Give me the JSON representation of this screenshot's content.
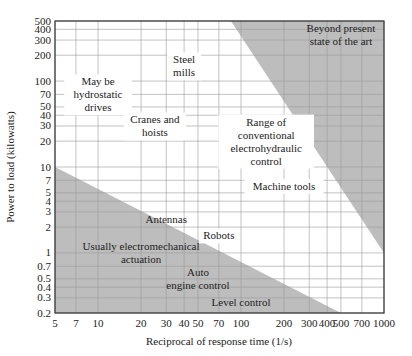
{
  "chart_data": {
    "type": "area",
    "title": "",
    "xlabel": "Reciprocal of response time (1/s)",
    "ylabel": "Power to load (kilowatts)",
    "xscale": "log",
    "yscale": "log",
    "xlim": [
      5,
      1000
    ],
    "ylim": [
      0.2,
      500
    ],
    "grid": true,
    "x_ticks": [
      5,
      7,
      10,
      20,
      30,
      40,
      50,
      70,
      100,
      200,
      300,
      400,
      500,
      700,
      1000
    ],
    "x_tick_labels": [
      "5",
      "7",
      "10",
      "20",
      "30",
      "40",
      "50",
      "70",
      "100",
      "200",
      "300",
      "400",
      "500",
      "700",
      "1000"
    ],
    "y_ticks": [
      0.2,
      0.3,
      0.4,
      0.5,
      0.7,
      1,
      2,
      3,
      4,
      5,
      7,
      10,
      20,
      30,
      40,
      50,
      70,
      100,
      200,
      300,
      400,
      500
    ],
    "y_tick_labels": [
      "0.2",
      "0.3",
      "0.4",
      "0.5",
      "0.7",
      "1",
      "2",
      "3",
      "4",
      "5",
      "7",
      "10",
      "20",
      "30",
      "40",
      "50",
      "70",
      "100",
      "200",
      "300",
      "400",
      "500"
    ],
    "series": [
      {
        "name": "Usually electromechanical actuation (lower boundary)",
        "x": [
          5,
          500
        ],
        "y": [
          10,
          0.2
        ]
      },
      {
        "name": "Beyond present state of the art (upper boundary)",
        "x": [
          85,
          1000
        ],
        "y": [
          500,
          1
        ]
      }
    ],
    "regions": [
      {
        "name": "Usually electromechanical actuation",
        "shaded": true
      },
      {
        "name": "Beyond present state of the art",
        "shaded": true
      },
      {
        "name": "Range of conventional electrohydraulic control",
        "shaded": false
      }
    ],
    "annotations": [
      {
        "text": [
          "Steel",
          "mills"
        ],
        "x": 40,
        "y": 150
      },
      {
        "text": [
          "May be",
          "hydrostatic",
          "drives"
        ],
        "x": 10,
        "y": 70
      },
      {
        "text": [
          "Cranes and",
          "hoists"
        ],
        "x": 25,
        "y": 30
      },
      {
        "text": [
          "Range of",
          "conventional",
          "electrohydraulic",
          "control"
        ],
        "x": 150,
        "y": 20
      },
      {
        "text": [
          "Machine tools"
        ],
        "x": 200,
        "y": 6
      },
      {
        "text": [
          "Beyond present",
          "state of the art"
        ],
        "x": 500,
        "y": 350
      },
      {
        "text": [
          "Antennas"
        ],
        "x": 30,
        "y": 2.5
      },
      {
        "text": [
          "Robots"
        ],
        "x": 70,
        "y": 1.6
      },
      {
        "text": [
          "Usually electromechanical",
          "actuation"
        ],
        "x": 20,
        "y": 1
      },
      {
        "text": [
          "Auto",
          "engine control"
        ],
        "x": 50,
        "y": 0.5
      },
      {
        "text": [
          "Level control"
        ],
        "x": 100,
        "y": 0.27
      }
    ],
    "colors": {
      "shade": "#bdbdbd",
      "grid": "#9a9a9a",
      "frame": "#333333"
    }
  }
}
